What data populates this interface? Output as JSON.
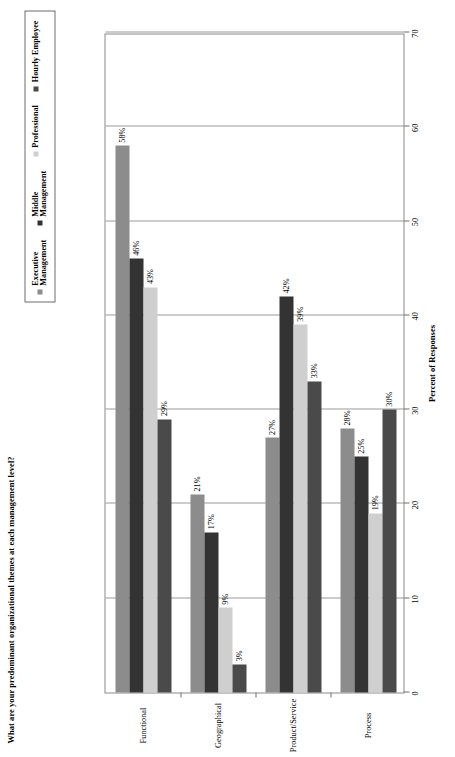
{
  "chart_data": {
    "type": "bar",
    "orientation": "horizontal",
    "title": "What are your predominant organizational themes at each management level?",
    "xlabel": "Percent of Responses",
    "ylabel": "",
    "xlim": [
      0,
      70
    ],
    "xticks": [
      0,
      10,
      20,
      30,
      40,
      50,
      60,
      70
    ],
    "grid": true,
    "legend_position": "top-right",
    "categories": [
      "Functional",
      "Geographical",
      "Product/Service",
      "Process"
    ],
    "series": [
      {
        "name": "Executive\nManagement",
        "color": "#8c8c8c",
        "values": [
          58,
          21,
          27,
          28
        ],
        "labels": [
          "58%",
          "21%",
          "27%",
          "28%"
        ]
      },
      {
        "name": "Middle\nManagement",
        "color": "#333333",
        "values": [
          46,
          17,
          42,
          25
        ],
        "labels": [
          "46%",
          "17%",
          "42%",
          "25%"
        ]
      },
      {
        "name": "Professional",
        "color": "#cfcfcf",
        "values": [
          43,
          9,
          39,
          19
        ],
        "labels": [
          "43%",
          "9%",
          "39%",
          "19%"
        ]
      },
      {
        "name": "Hourly Employee",
        "color": "#4a4a4a",
        "values": [
          29,
          3,
          33,
          30
        ],
        "labels": [
          "29%",
          "3%",
          "33%",
          "30%"
        ]
      }
    ]
  },
  "legend": {
    "items": [
      {
        "label": "Executive\nManagement",
        "color": "#8c8c8c"
      },
      {
        "label": "Middle\nManagement",
        "color": "#333333"
      },
      {
        "label": "Professional",
        "color": "#cfcfcf"
      },
      {
        "label": "Hourly Employee",
        "color": "#4a4a4a"
      }
    ]
  },
  "axis": {
    "tick_labels": [
      "0",
      "10",
      "20",
      "30",
      "40",
      "50",
      "60",
      "70"
    ],
    "title": "Percent of Responses"
  },
  "colors": {
    "plot_border": "#8a8a8a",
    "gridline": "#9a9a9a",
    "background": "#ffffff",
    "text": "#000000"
  }
}
